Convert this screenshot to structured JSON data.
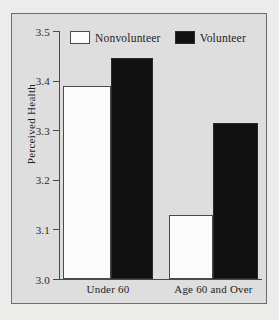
{
  "chart_data": {
    "type": "bar",
    "title": "",
    "xlabel": "",
    "ylabel": "Perceived Health",
    "categories": [
      "Under 60",
      "Age 60 and Over"
    ],
    "series": [
      {
        "name": "Nonvolunteer",
        "color": "#ffffff",
        "values": [
          3.39,
          3.13
        ]
      },
      {
        "name": "Volunteer",
        "color": "#000000",
        "values": [
          3.445,
          3.315
        ]
      }
    ],
    "ylim": [
      3.0,
      3.5
    ],
    "yticks": [
      "3.0",
      "3.1",
      "3.2",
      "3.3",
      "3.4",
      "3.5"
    ],
    "ytick_values": [
      3.0,
      3.1,
      3.2,
      3.3,
      3.4,
      3.5
    ],
    "grid": false,
    "legend_position": "top-center"
  },
  "legend": {
    "items": [
      {
        "label": "Nonvolunteer",
        "swatch": "white-square-icon"
      },
      {
        "label": "Volunteer",
        "swatch": "black-square-icon"
      }
    ]
  },
  "axes": {
    "y_title": "Perceived Health",
    "y_ticks": [
      "3.5",
      "3.4",
      "3.3",
      "3.2",
      "3.1",
      "3.0"
    ],
    "x_categories": [
      "Under 60",
      "Age 60 and Over"
    ]
  }
}
